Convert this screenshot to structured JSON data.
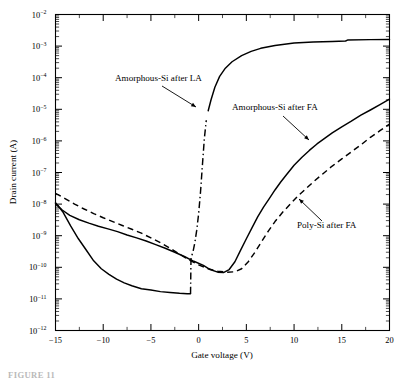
{
  "figure": {
    "caption_partial": "FIGURE 11"
  },
  "chart_data": {
    "type": "line",
    "title": "",
    "xlabel": "Gate voltage (V)",
    "ylabel": "Drain current (A)",
    "xlim": [
      -15,
      20
    ],
    "ylim": [
      1e-12,
      0.01
    ],
    "yscale": "log",
    "xscale": "linear",
    "grid": false,
    "legend_position": "inline-annotations",
    "xticks": [
      -15,
      -10,
      -5,
      0,
      5,
      10,
      15,
      20
    ],
    "xtick_labels": [
      "−15",
      "−10",
      "−5",
      "0",
      "5",
      "10",
      "15",
      "20"
    ],
    "yticks": [
      0.01,
      0.001,
      0.0001,
      1e-05,
      1e-06,
      1e-07,
      1e-08,
      1e-09,
      1e-10,
      1e-11,
      1e-12
    ],
    "ytick_labels": [
      "10⁻²",
      "10⁻³",
      "10⁻⁴",
      "10⁻⁵",
      "10⁻⁶",
      "10⁻⁷",
      "10⁻⁸",
      "10⁻⁹",
      "10⁻¹⁰",
      "10⁻¹¹",
      "10⁻¹²"
    ],
    "ytick_exponents": [
      "-2",
      "-3",
      "-4",
      "-5",
      "-6",
      "-7",
      "-8",
      "-9",
      "-10",
      "-11",
      "-12"
    ],
    "series": [
      {
        "name": "Amorphous-Si after LA",
        "style": "solid-with-dashdot-transition",
        "points": [
          [
            -15,
            1.1e-08
          ],
          [
            -14.2,
            5.5e-09
          ],
          [
            -13.4,
            2e-09
          ],
          [
            -12.6,
            8e-10
          ],
          [
            -11.8,
            3.6e-10
          ],
          [
            -11.0,
            1.6e-10
          ],
          [
            -10.2,
            9e-11
          ],
          [
            -9.4,
            6e-11
          ],
          [
            -8.6,
            4.2e-11
          ],
          [
            -7.8,
            3.2e-11
          ],
          [
            -7.0,
            2.6e-11
          ],
          [
            -6.0,
            2.1e-11
          ],
          [
            -5.0,
            1.9e-11
          ],
          [
            -4.0,
            1.7e-11
          ],
          [
            -3.0,
            1.6e-11
          ],
          [
            -2.0,
            1.5e-11
          ],
          [
            -1.2,
            1.45e-11
          ],
          [
            -0.85,
            1.45e-11
          ],
          [
            -0.8,
            2e-10
          ],
          [
            -0.6,
            3e-10
          ],
          [
            -0.4,
            6e-10
          ],
          [
            -0.2,
            1.5e-09
          ],
          [
            0.0,
            5e-09
          ],
          [
            0.2,
            2.5e-08
          ],
          [
            0.4,
            1.8e-07
          ],
          [
            0.6,
            1.2e-06
          ],
          [
            0.8,
            4.5e-06
          ],
          [
            1.0,
            9e-06
          ],
          [
            1.3,
            2e-05
          ],
          [
            1.7,
            5e-05
          ],
          [
            2.2,
            0.00011
          ],
          [
            2.8,
            0.0002
          ],
          [
            3.5,
            0.00032
          ],
          [
            4.5,
            0.0005
          ],
          [
            5.5,
            0.00068
          ],
          [
            6.5,
            0.00085
          ],
          [
            8.0,
            0.00105
          ],
          [
            10.0,
            0.00125
          ],
          [
            12.0,
            0.00135
          ],
          [
            14.0,
            0.0014
          ],
          [
            15.4,
            0.00145
          ],
          [
            15.6,
            0.00155
          ],
          [
            18.0,
            0.0016
          ],
          [
            20,
            0.00162
          ]
        ],
        "transition_x_range": [
          -0.85,
          0.95
        ],
        "saturation_current": 0.0016,
        "minimum_current": 1.45e-11
      },
      {
        "name": "Amorphous-Si after FA",
        "style": "solid",
        "points": [
          [
            -15,
            1.05e-08
          ],
          [
            -14.3,
            6.5e-09
          ],
          [
            -13.5,
            4.4e-09
          ],
          [
            -12.5,
            3.2e-09
          ],
          [
            -11.5,
            2.5e-09
          ],
          [
            -10.5,
            2e-09
          ],
          [
            -9.5,
            1.65e-09
          ],
          [
            -8.5,
            1.35e-09
          ],
          [
            -7.5,
            1.05e-09
          ],
          [
            -6.5,
            8.5e-10
          ],
          [
            -5.5,
            6.8e-10
          ],
          [
            -4.5,
            5.2e-10
          ],
          [
            -3.5,
            4e-10
          ],
          [
            -2.5,
            3e-10
          ],
          [
            -1.5,
            2.2e-10
          ],
          [
            -0.5,
            1.55e-10
          ],
          [
            0.5,
            1.15e-10
          ],
          [
            1.2,
            8.5e-11
          ],
          [
            2.0,
            7e-11
          ],
          [
            2.6,
            6.8e-11
          ],
          [
            3.2,
            8.5e-11
          ],
          [
            3.8,
            1.5e-10
          ],
          [
            4.4,
            3.5e-10
          ],
          [
            5.0,
            8e-10
          ],
          [
            5.6,
            1.8e-09
          ],
          [
            6.2,
            4e-09
          ],
          [
            6.8,
            8e-09
          ],
          [
            7.4,
            1.5e-08
          ],
          [
            8.0,
            2.8e-08
          ],
          [
            8.6,
            5e-08
          ],
          [
            9.2,
            8.5e-08
          ],
          [
            10.0,
            1.7e-07
          ],
          [
            10.8,
            3e-07
          ],
          [
            11.6,
            5e-07
          ],
          [
            12.4,
            8e-07
          ],
          [
            13.2,
            1.2e-06
          ],
          [
            14.0,
            1.8e-06
          ],
          [
            15.0,
            2.8e-06
          ],
          [
            16.0,
            4.2e-06
          ],
          [
            17.0,
            6.5e-06
          ],
          [
            18.0,
            9.5e-06
          ],
          [
            19.0,
            1.4e-05
          ],
          [
            20,
            2.1e-05
          ]
        ],
        "minimum_current": 6.8e-11
      },
      {
        "name": "Poly-Si after FA",
        "style": "dashed",
        "points": [
          [
            -15,
            2.2e-08
          ],
          [
            -14,
            1.5e-08
          ],
          [
            -13,
            1e-08
          ],
          [
            -12,
            7e-09
          ],
          [
            -11,
            5e-09
          ],
          [
            -10,
            3.7e-09
          ],
          [
            -9,
            2.8e-09
          ],
          [
            -8,
            2.1e-09
          ],
          [
            -7,
            1.6e-09
          ],
          [
            -6,
            1.2e-09
          ],
          [
            -5,
            8.5e-10
          ],
          [
            -4,
            6e-10
          ],
          [
            -3,
            4e-10
          ],
          [
            -2,
            2.6e-10
          ],
          [
            -1,
            1.7e-10
          ],
          [
            0,
            1.2e-10
          ],
          [
            1.0,
            9e-11
          ],
          [
            2.0,
            7.5e-11
          ],
          [
            3.0,
            7e-11
          ],
          [
            3.8,
            7.2e-11
          ],
          [
            4.5,
            9e-11
          ],
          [
            5.2,
            1.5e-10
          ],
          [
            5.9,
            3e-10
          ],
          [
            6.6,
            6.5e-10
          ],
          [
            7.3,
            1.4e-09
          ],
          [
            8.0,
            2.8e-09
          ],
          [
            8.8,
            5.5e-09
          ],
          [
            9.6,
            1e-08
          ],
          [
            10.4,
            1.8e-08
          ],
          [
            11.2,
            3e-08
          ],
          [
            12.0,
            5e-08
          ],
          [
            13.0,
            9e-08
          ],
          [
            14.0,
            1.6e-07
          ],
          [
            15.0,
            2.7e-07
          ],
          [
            16.0,
            4.5e-07
          ],
          [
            17.0,
            7.5e-07
          ],
          [
            18.0,
            1.3e-06
          ],
          [
            19.0,
            2.1e-06
          ],
          [
            20,
            3.4e-06
          ]
        ],
        "minimum_current": 7e-11
      }
    ],
    "annotations": [
      {
        "text": "Amorphous-Si after LA",
        "text_x": 115,
        "text_y": 81,
        "anchor": "start",
        "leader_from": [
          162,
          86
        ],
        "leader_to": [
          196,
          107
        ]
      },
      {
        "text": "Amorphous-Si after FA",
        "text_x": 232,
        "text_y": 110,
        "anchor": "start",
        "leader_from": [
          283,
          116
        ],
        "leader_to": [
          309,
          140
        ]
      },
      {
        "text": "Poly-Si after FA",
        "text_x": 297,
        "text_y": 228,
        "anchor": "start",
        "leader_from": [
          322,
          221
        ],
        "leader_to": [
          299,
          199
        ]
      }
    ]
  }
}
